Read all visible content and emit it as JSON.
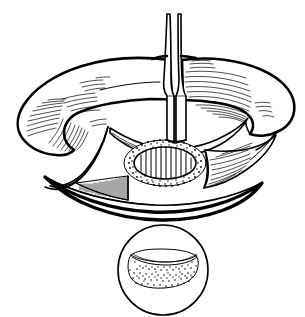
{
  "figure": {
    "domain": "medical-line-illustration",
    "background_color": "#ffffff",
    "ink_color": "#000000",
    "canvas": {
      "width": 305,
      "height": 317
    },
    "style": "black ink line drawing, pen-and-ink hatching and stippling, no color, no text labels",
    "visible_text": []
  },
  "parts": {
    "instrument": {
      "name": "vertical surgical instrument",
      "kind": "elevator-retractor-blade",
      "top_y": 14,
      "tip_y": 143,
      "shaft_x": 176,
      "width_top": 5,
      "width_bottom": 14,
      "description": "narrow two-pronged blade descending from top edge into the wound, tip resting at the superior margin of the striped oval"
    },
    "left_lobe": {
      "name": "left tissue lobe",
      "hatch_style": "curved fan hatching",
      "hatch_groups": 3,
      "description": "broad rounded lobe of retracted tissue on the left with fan-shaped curved hatch lines at its inferior tip"
    },
    "right_lobe": {
      "name": "right tissue lobe",
      "hatch_style": "long flowing parallel fiber lines",
      "hatch_groups": 2,
      "description": "broad rounded lobe of retracted tissue on the right with long horizontal muscle-fiber hatch lines"
    },
    "central_oval": {
      "name": "striped oval structure",
      "center_x": 165,
      "center_y": 163,
      "radius_x": 36,
      "radius_y": 19,
      "stripe_count": 11,
      "stripe_orientation": "vertical",
      "rim": "stippled dotted border",
      "description": "exposed oval structure filled with vertical stripes and ringed by a dense stippled margin"
    },
    "lower_crescent": {
      "name": "inferior wound edge crescent",
      "description": "boat-shaped crescent forming the lower lip of the exposure, drawn with a heavy outer contour"
    },
    "hatched_wedge": {
      "name": "hatched wedge",
      "location": "lower-left of wound floor",
      "hatch_orientation": "vertical dense",
      "description": "dark triangular wedge of densely hatched cut tissue"
    },
    "right_inner_hatch": {
      "name": "right inner wound hatching",
      "hatch_orientation": "diagonal",
      "description": "diagonal hatch lines on the inner right wall of the wound"
    },
    "inset": {
      "name": "magnified inset circle",
      "center_x": 163,
      "center_y": 270,
      "radius": 45,
      "contents": "stippled rounded-rectangle cross-section with curved upper lip",
      "description": "circular detail view showing the oval structure in cross-section, filled with stipple dots"
    }
  }
}
